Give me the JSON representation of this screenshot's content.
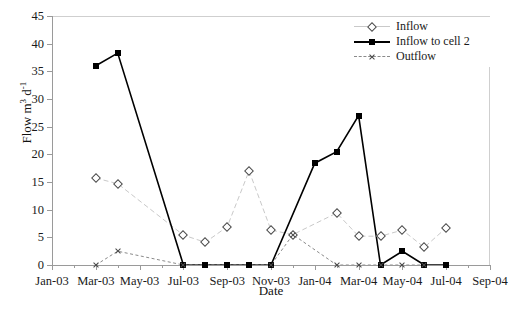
{
  "chart_data": {
    "type": "line",
    "title": "",
    "xlabel": "Date",
    "ylabel": "Flow m3 d-1",
    "ylabel_parts": {
      "base": "Flow m",
      "exp1": "3",
      "mid": " d",
      "exp2": "-1"
    },
    "ylim": [
      0,
      45
    ],
    "yticks": [
      0,
      5,
      10,
      15,
      20,
      25,
      30,
      35,
      40,
      45
    ],
    "xticks": [
      "Jan-03",
      "Mar-03",
      "May-03",
      "Jul-03",
      "Sep-03",
      "Nov-03",
      "Jan-04",
      "Mar-04",
      "May-04",
      "Jul-04",
      "Sep-04"
    ],
    "x": [
      "Jan-03",
      "Feb-03",
      "Mar-03",
      "Apr-03",
      "May-03",
      "Jun-03",
      "Jul-03",
      "Aug-03",
      "Sep-03",
      "Oct-03",
      "Nov-03",
      "Dec-03",
      "Jan-04",
      "Feb-04",
      "Mar-04",
      "Apr-04",
      "May-04",
      "Jun-04",
      "Jul-04",
      "Aug-04",
      "Sep-04"
    ],
    "grid": false,
    "legend_position": "top-right",
    "series": [
      {
        "name": "Inflow",
        "marker": "diamond-open",
        "line_color": "#c9c9c9",
        "marker_color": "#4a4a4a",
        "points": [
          {
            "x": "Mar-03",
            "y": 15.7
          },
          {
            "x": "Apr-03",
            "y": 14.7
          },
          {
            "x": "Jul-03",
            "y": 5.4
          },
          {
            "x": "Aug-03",
            "y": 4.1
          },
          {
            "x": "Sep-03",
            "y": 6.9
          },
          {
            "x": "Oct-03",
            "y": 17.0
          },
          {
            "x": "Nov-03",
            "y": 6.3
          },
          {
            "x": "Dec-03",
            "y": 5.5
          },
          {
            "x": "Feb-04",
            "y": 9.4
          },
          {
            "x": "Mar-04",
            "y": 5.2
          },
          {
            "x": "Apr-04",
            "y": 5.2
          },
          {
            "x": "May-04",
            "y": 6.3
          },
          {
            "x": "Jun-04",
            "y": 3.2
          },
          {
            "x": "Jul-04",
            "y": 6.7
          }
        ]
      },
      {
        "name": "Inflow to cell 2",
        "marker": "square-filled",
        "line_color": "#000000",
        "marker_color": "#000000",
        "points": [
          {
            "x": "Mar-03",
            "y": 36.0
          },
          {
            "x": "Apr-03",
            "y": 38.3
          },
          {
            "x": "Jul-03",
            "y": 0.0
          },
          {
            "x": "Aug-03",
            "y": 0.0
          },
          {
            "x": "Sep-03",
            "y": 0.0
          },
          {
            "x": "Oct-03",
            "y": 0.0
          },
          {
            "x": "Nov-03",
            "y": 0.0
          },
          {
            "x": "Jan-04",
            "y": 18.4
          },
          {
            "x": "Feb-04",
            "y": 20.5
          },
          {
            "x": "Mar-04",
            "y": 27.0
          },
          {
            "x": "Apr-04",
            "y": 0.0
          },
          {
            "x": "May-04",
            "y": 2.5
          },
          {
            "x": "Jun-04",
            "y": 0.0
          },
          {
            "x": "Jul-04",
            "y": 0.0
          }
        ]
      },
      {
        "name": "Outflow",
        "marker": "cross",
        "line_color": "#8a8a8a",
        "marker_color": "#4a4a4a",
        "points": [
          {
            "x": "Mar-03",
            "y": 0.0
          },
          {
            "x": "Apr-03",
            "y": 2.5
          },
          {
            "x": "Jul-03",
            "y": 0.0
          },
          {
            "x": "Nov-03",
            "y": 0.0
          },
          {
            "x": "Dec-03",
            "y": 5.5
          },
          {
            "x": "Feb-04",
            "y": 0.0
          },
          {
            "x": "Mar-04",
            "y": 0.0
          },
          {
            "x": "Apr-04",
            "y": 0.0
          },
          {
            "x": "May-04",
            "y": 0.0
          },
          {
            "x": "Jun-04",
            "y": 0.0
          }
        ]
      }
    ]
  },
  "legend": {
    "items": [
      {
        "label": "Inflow"
      },
      {
        "label": "Inflow to cell 2"
      },
      {
        "label": "Outflow"
      }
    ]
  }
}
